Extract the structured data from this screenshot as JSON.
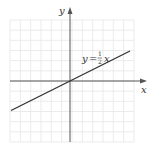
{
  "chart_data": {
    "type": "line",
    "title": "",
    "xlabel": "x",
    "ylabel": "y",
    "xlim": [
      -6,
      6
    ],
    "ylim": [
      -6,
      6
    ],
    "grid": true,
    "series": [
      {
        "name": "y = 1/2 x",
        "equation": "y = (1/2)x",
        "slope": 0.5,
        "intercept": 0,
        "x": [
          -6,
          6
        ],
        "y": [
          -3,
          3
        ]
      }
    ],
    "annotations": [
      {
        "text": "y = ½x",
        "position": "above line, right of y-axis"
      }
    ]
  },
  "labels": {
    "x_axis": "x",
    "y_axis": "y",
    "eq_y": "y",
    "eq_equals": "=",
    "eq_num": "1",
    "eq_den": "2",
    "eq_x": "x"
  },
  "colors": {
    "grid": "#e6e6e6",
    "axis": "#555555",
    "line": "#333333"
  }
}
